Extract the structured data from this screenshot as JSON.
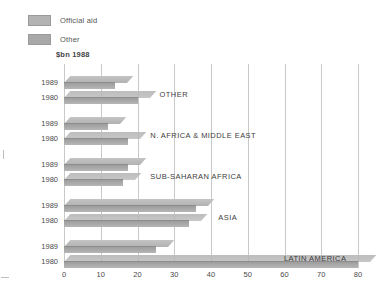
{
  "legend": {
    "items": [
      {
        "label": "Official aid",
        "color": "#b3b3b3",
        "icon": "legend-swatch-icon"
      },
      {
        "label": "Other",
        "color": "#a8a8a8",
        "icon": "legend-swatch-icon"
      }
    ]
  },
  "axis": {
    "unit_title": "$bn 1988",
    "xticks": [
      "0",
      "10",
      "20",
      "30",
      "40",
      "50",
      "60",
      "70",
      "80"
    ]
  },
  "groups": [
    {
      "label": "OTHER",
      "year_top": "1989",
      "year_bottom": "1980"
    },
    {
      "label": "N. AFRICA & MIDDLE EAST",
      "year_top": "1989",
      "year_bottom": "1980"
    },
    {
      "label": "SUB-SAHARAN AFRICA",
      "year_top": "1989",
      "year_bottom": "1980"
    },
    {
      "label": "ASIA",
      "year_top": "1989",
      "year_bottom": "1980"
    },
    {
      "label": "LATIN AMERICA",
      "year_top": "1989",
      "year_bottom": "1980"
    }
  ],
  "chart_data": {
    "type": "bar",
    "orientation": "horizontal",
    "title": "",
    "subtitle": "",
    "xlabel": "$bn 1988",
    "ylabel": "",
    "xlim": [
      0,
      80
    ],
    "xticks": [
      0,
      10,
      20,
      30,
      40,
      50,
      60,
      70,
      80
    ],
    "grid": "vertical",
    "legend_position": "top-left",
    "legend_entries": [
      "Official aid",
      "Other"
    ],
    "categories": [
      "OTHER",
      "N. AFRICA & MIDDLE EAST",
      "SUB-SAHARAN AFRICA",
      "ASIA",
      "LATIN AMERICA"
    ],
    "series": [
      {
        "name": "1989",
        "values": [
          14,
          12,
          17.5,
          36,
          25
        ]
      },
      {
        "name": "1980",
        "values": [
          20,
          17.5,
          16,
          34,
          80
        ]
      }
    ]
  }
}
